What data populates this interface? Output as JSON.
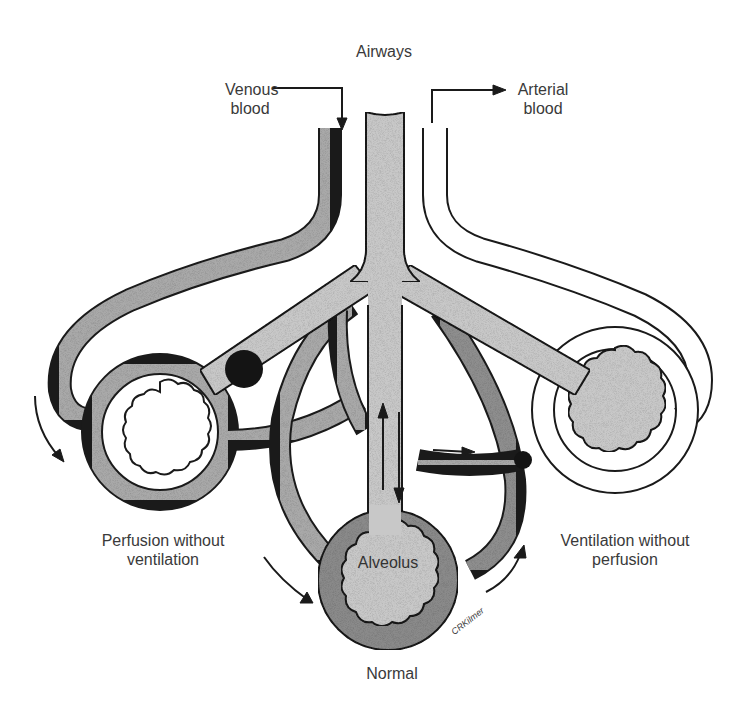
{
  "diagram": {
    "labels": {
      "airways": "Airways",
      "venous_line1": "Venous",
      "venous_line2": "blood",
      "arterial_line1": "Arterial",
      "arterial_line2": "blood",
      "alveolus": "Alveolus",
      "normal": "Normal",
      "left_line1": "Perfusion without",
      "left_line2": "ventilation",
      "right_line1": "Ventilation without",
      "right_line2": "perfusion",
      "signature": "CRKilmer"
    },
    "colors": {
      "airway_fill": "#c8c8c8",
      "venous_fill": "#a9a9a9",
      "arterial_fill": "#7a7a7a",
      "outline": "#1a1a1a",
      "blockage": "#141414",
      "text": "#3a3a3a",
      "background": "#ffffff"
    },
    "regions": [
      {
        "name": "perfusion-without-ventilation",
        "alveolus_state": "collapsed/airway blocked",
        "capillary": "perfused"
      },
      {
        "name": "normal",
        "alveolus_state": "ventilated",
        "capillary": "perfused"
      },
      {
        "name": "ventilation-without-perfusion",
        "alveolus_state": "ventilated",
        "capillary": "blocked/unperfused"
      }
    ]
  }
}
